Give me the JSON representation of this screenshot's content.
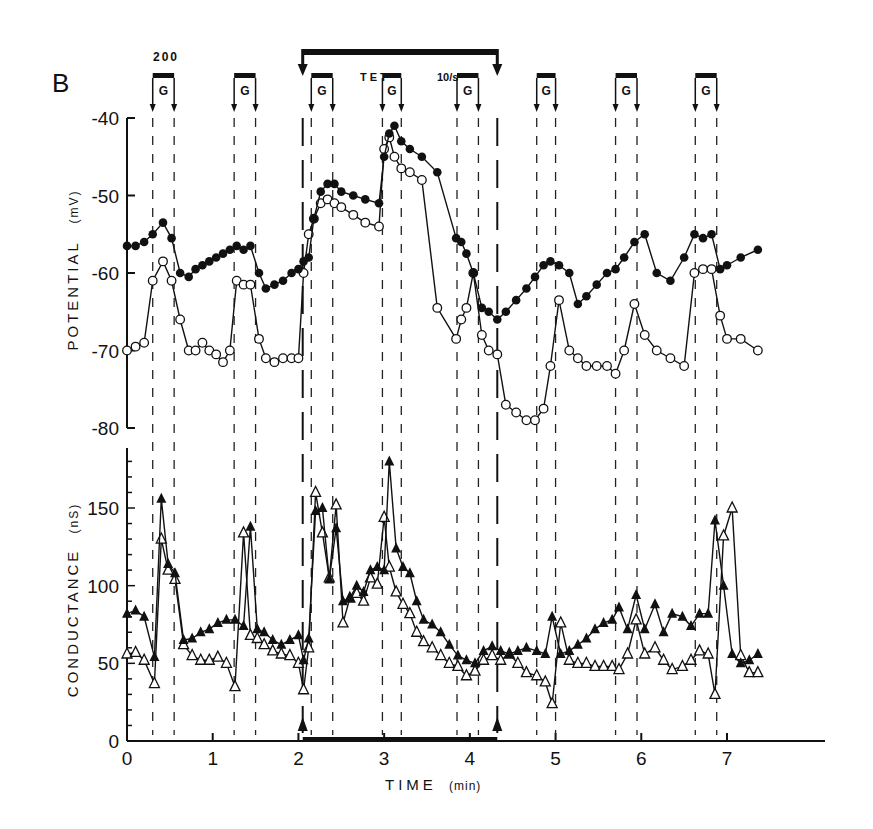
{
  "panel_label": "B",
  "chart_data": [
    {
      "type": "line",
      "title": "",
      "panel": "B (top)",
      "xlabel": "TIME (min)",
      "ylabel": "POTENTIAL (mV)",
      "xlim": [
        0,
        7.5
      ],
      "ylim": [
        -80,
        -40
      ],
      "yticks": [
        -40,
        -50,
        -60,
        -70,
        -80
      ],
      "xticks": [
        0,
        1,
        2,
        3,
        4,
        5,
        6,
        7
      ],
      "grid": false,
      "series": [
        {
          "name": "filled circles",
          "marker": "filled-circle",
          "x": [
            0.0,
            0.1,
            0.2,
            0.3,
            0.42,
            0.52,
            0.62,
            0.72,
            0.8,
            0.88,
            0.96,
            1.04,
            1.12,
            1.2,
            1.28,
            1.36,
            1.44,
            1.54,
            1.62,
            1.72,
            1.82,
            1.92,
            2.0,
            2.06,
            2.12,
            2.18,
            2.26,
            2.34,
            2.42,
            2.5,
            2.64,
            2.78,
            2.94,
            3.0,
            3.06,
            3.12,
            3.2,
            3.3,
            3.44,
            3.62,
            3.84,
            3.9,
            3.96,
            4.04,
            4.14,
            4.22,
            4.32,
            4.42,
            4.54,
            4.66,
            4.76,
            4.86,
            4.94,
            5.04,
            5.16,
            5.26,
            5.36,
            5.48,
            5.6,
            5.7,
            5.8,
            5.92,
            6.04,
            6.18,
            6.34,
            6.5,
            6.62,
            6.72,
            6.82,
            6.92,
            7.0,
            7.16,
            7.36
          ],
          "y": [
            -56.5,
            -56.5,
            -56,
            -55,
            -53.5,
            -55.5,
            -60,
            -60.5,
            -59.5,
            -59,
            -58.5,
            -58,
            -57.5,
            -57,
            -56.5,
            -57,
            -56.5,
            -60,
            -62,
            -61.5,
            -61,
            -60,
            -59.5,
            -58.5,
            -58,
            -53,
            -49.5,
            -48.5,
            -48.5,
            -49.5,
            -50,
            -50.5,
            -51,
            -45,
            -42,
            -41,
            -43,
            -44,
            -45,
            -47,
            -55.5,
            -56,
            -57.5,
            -60,
            -64.5,
            -65,
            -66,
            -65,
            -63.5,
            -62,
            -60.5,
            -59,
            -58.5,
            -59,
            -60,
            -64,
            -63,
            -61.5,
            -60,
            -59.5,
            -58,
            -56,
            -55,
            -60,
            -61,
            -58,
            -55,
            -55.5,
            -55,
            -59.5,
            -59,
            -58,
            -57
          ]
        },
        {
          "name": "open circles",
          "marker": "open-circle",
          "x": [
            0.0,
            0.1,
            0.2,
            0.3,
            0.42,
            0.52,
            0.62,
            0.72,
            0.8,
            0.88,
            0.96,
            1.04,
            1.12,
            1.2,
            1.28,
            1.36,
            1.44,
            1.54,
            1.62,
            1.72,
            1.82,
            1.92,
            2.0,
            2.06,
            2.12,
            2.18,
            2.26,
            2.34,
            2.42,
            2.5,
            2.64,
            2.78,
            2.94,
            3.0,
            3.06,
            3.12,
            3.2,
            3.3,
            3.44,
            3.62,
            3.84,
            3.9,
            3.96,
            4.04,
            4.14,
            4.22,
            4.32,
            4.42,
            4.54,
            4.66,
            4.76,
            4.86,
            4.94,
            5.04,
            5.16,
            5.26,
            5.36,
            5.48,
            5.6,
            5.7,
            5.8,
            5.92,
            6.04,
            6.18,
            6.34,
            6.5,
            6.62,
            6.72,
            6.82,
            6.92,
            7.0,
            7.16,
            7.36
          ],
          "y": [
            -70,
            -69.5,
            -69,
            -61,
            -58.5,
            -61,
            -66,
            -70,
            -70,
            -69,
            -70,
            -70.5,
            -71.5,
            -70,
            -61,
            -61.5,
            -61.5,
            -68.5,
            -71,
            -71.5,
            -71,
            -71,
            -71,
            -60,
            -55,
            -53,
            -51,
            -50.5,
            -51,
            -51.5,
            -52.5,
            -53.5,
            -54,
            -44,
            -42.5,
            -45,
            -46.5,
            -47,
            -48,
            -64.5,
            -68.5,
            -66,
            -64.5,
            -60,
            -68,
            -70,
            -70.5,
            -77,
            -78,
            -79,
            -79,
            -77.5,
            -72,
            -63.5,
            -70,
            -71,
            -72,
            -72,
            -72,
            -73,
            -70,
            -64,
            -68,
            -70,
            -71,
            -72,
            -60,
            -59.5,
            -59.5,
            -65.5,
            -68.5,
            -68.5,
            -70
          ]
        }
      ]
    },
    {
      "type": "line",
      "title": "",
      "panel": "B (bottom)",
      "xlabel": "TIME (min)",
      "ylabel": "CONDUCTANCE (nS)",
      "xlim": [
        0,
        7.5
      ],
      "ylim": [
        0,
        185
      ],
      "yticks": [
        0,
        50,
        100,
        150
      ],
      "xticks": [
        0,
        1,
        2,
        3,
        4,
        5,
        6,
        7
      ],
      "grid": false,
      "series": [
        {
          "name": "filled triangles",
          "marker": "filled-triangle",
          "x": [
            0.0,
            0.1,
            0.2,
            0.32,
            0.4,
            0.48,
            0.56,
            0.66,
            0.76,
            0.86,
            0.96,
            1.06,
            1.16,
            1.26,
            1.36,
            1.44,
            1.52,
            1.6,
            1.7,
            1.8,
            1.9,
            2.0,
            2.06,
            2.12,
            2.2,
            2.28,
            2.36,
            2.44,
            2.52,
            2.6,
            2.68,
            2.76,
            2.84,
            2.92,
            3.0,
            3.06,
            3.14,
            3.22,
            3.3,
            3.38,
            3.46,
            3.56,
            3.66,
            3.76,
            3.86,
            3.96,
            4.06,
            4.16,
            4.26,
            4.36,
            4.46,
            4.56,
            4.66,
            4.78,
            4.88,
            4.96,
            5.06,
            5.16,
            5.26,
            5.36,
            5.46,
            5.56,
            5.66,
            5.74,
            5.84,
            5.94,
            6.04,
            6.16,
            6.26,
            6.36,
            6.48,
            6.58,
            6.68,
            6.78,
            6.86,
            6.96,
            7.06,
            7.16,
            7.26,
            7.36
          ],
          "y": [
            82,
            84,
            80,
            54,
            156,
            114,
            108,
            65,
            66,
            70,
            72,
            76,
            78,
            78,
            74,
            138,
            72,
            70,
            65,
            62,
            65,
            68,
            52,
            66,
            148,
            150,
            104,
            137,
            90,
            92,
            100,
            96,
            110,
            112,
            110,
            180,
            124,
            112,
            108,
            90,
            78,
            75,
            70,
            62,
            55,
            52,
            50,
            58,
            61,
            58,
            56,
            58,
            60,
            58,
            56,
            80,
            56,
            58,
            62,
            66,
            72,
            76,
            78,
            86,
            72,
            94,
            72,
            88,
            70,
            82,
            80,
            74,
            82,
            82,
            142,
            100,
            56,
            50,
            52,
            56
          ],
          "note": "partial reading; values approximate"
        },
        {
          "name": "open triangles",
          "marker": "open-triangle",
          "x": [
            0.0,
            0.1,
            0.2,
            0.32,
            0.4,
            0.48,
            0.56,
            0.66,
            0.76,
            0.86,
            0.96,
            1.06,
            1.16,
            1.26,
            1.36,
            1.44,
            1.52,
            1.6,
            1.7,
            1.8,
            1.9,
            2.0,
            2.06,
            2.12,
            2.2,
            2.28,
            2.36,
            2.44,
            2.52,
            2.6,
            2.68,
            2.76,
            2.84,
            2.92,
            3.0,
            3.06,
            3.14,
            3.22,
            3.3,
            3.38,
            3.46,
            3.56,
            3.66,
            3.76,
            3.86,
            3.96,
            4.06,
            4.16,
            4.26,
            4.36,
            4.46,
            4.56,
            4.66,
            4.78,
            4.88,
            4.96,
            5.06,
            5.16,
            5.26,
            5.36,
            5.46,
            5.56,
            5.66,
            5.74,
            5.84,
            5.94,
            6.04,
            6.16,
            6.26,
            6.36,
            6.48,
            6.58,
            6.68,
            6.78,
            6.86,
            6.96,
            7.06,
            7.16,
            7.26,
            7.36
          ],
          "y": [
            56,
            57,
            52,
            37,
            130,
            110,
            104,
            62,
            55,
            52,
            52,
            54,
            50,
            35,
            134,
            68,
            66,
            62,
            58,
            56,
            55,
            50,
            33,
            60,
            160,
            134,
            105,
            152,
            76,
            92,
            95,
            90,
            105,
            101,
            144,
            112,
            96,
            88,
            82,
            70,
            64,
            60,
            55,
            50,
            48,
            42,
            45,
            52,
            55,
            52,
            56,
            50,
            44,
            42,
            38,
            24,
            76,
            52,
            50,
            50,
            48,
            48,
            48,
            46,
            56,
            78,
            56,
            60,
            52,
            46,
            48,
            52,
            58,
            56,
            30,
            132,
            150,
            55,
            44,
            44,
            44
          ],
          "note": "partial reading; values approximate"
        }
      ]
    }
  ],
  "annotations": {
    "pulse_label_top": "200",
    "pulse_label": "G",
    "tet_label": "TET",
    "rate_label": "10/s",
    "g_pulses": [
      [
        0.3,
        0.55
      ],
      [
        1.25,
        1.5
      ],
      [
        2.15,
        2.4
      ],
      [
        2.98,
        3.2
      ],
      [
        3.85,
        4.1
      ],
      [
        4.78,
        5.0
      ],
      [
        5.7,
        5.95
      ],
      [
        6.63,
        6.88
      ]
    ],
    "tet_interval": [
      2.05,
      4.32
    ]
  },
  "axes": {
    "top_ylabel": "POTENTIAL",
    "top_yunit": "(mV)",
    "bottom_ylabel": "CONDUCTANCE",
    "bottom_yunit": "(nS)",
    "xlabel": "TIME",
    "xunit": "(min)",
    "top_yticks": [
      "-40",
      "-50",
      "-60",
      "-70",
      "-80"
    ],
    "bottom_yticks": [
      "150",
      "100",
      "50",
      "0"
    ],
    "xticks": [
      "0",
      "1",
      "2",
      "3",
      "4",
      "5",
      "6",
      "7"
    ]
  }
}
